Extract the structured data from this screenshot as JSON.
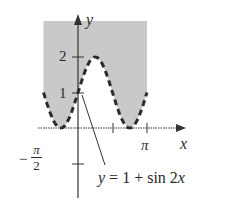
{
  "figure": {
    "type": "inequality-region-graph",
    "equation_label": "y = 1 + sin 2x",
    "equation_parts": {
      "lhs": "y",
      "eq": "=",
      "one": "1",
      "plus": "+",
      "func": "sin 2",
      "var": "x"
    },
    "axes": {
      "x_label": "x",
      "y_label": "y",
      "x_tick_labels": [
        {
          "value": "-π/2",
          "numerator": "π",
          "denominator": "2",
          "sign": "−"
        },
        {
          "value": "π",
          "text": "π"
        }
      ],
      "y_tick_labels": [
        "1",
        "2"
      ]
    },
    "boundary_style": "dashed",
    "shaded_region": "y > 1 + sin 2x",
    "colors": {
      "shade": "#c9c9c9",
      "curve": "#2b2b2b",
      "axis": "#333333",
      "text": "#2a2a2a"
    }
  },
  "chart_data": {
    "type": "area",
    "title": "",
    "function": "y = 1 + sin 2x",
    "xlabel": "x",
    "ylabel": "y",
    "xlim": [
      -1.5708,
      3.1416
    ],
    "ylim": [
      -1,
      3
    ],
    "x": [
      -1.5708,
      -1.1781,
      -0.7854,
      -0.3927,
      0,
      0.3927,
      0.7854,
      1.1781,
      1.5708,
      1.9635,
      2.3562,
      2.7489,
      3.1416
    ],
    "values": [
      1.0,
      0.293,
      0.0,
      0.293,
      1.0,
      1.707,
      2.0,
      1.707,
      1.0,
      0.293,
      0.0,
      0.293,
      1.0
    ],
    "shading": "above curve (y > 1 + sin 2x), x from -π/2 to π",
    "line_style": "dashed",
    "x_ticks": [
      "-π/2",
      "π/2",
      "π"
    ],
    "y_ticks": [
      "-1",
      "1",
      "2"
    ],
    "grid": false
  }
}
